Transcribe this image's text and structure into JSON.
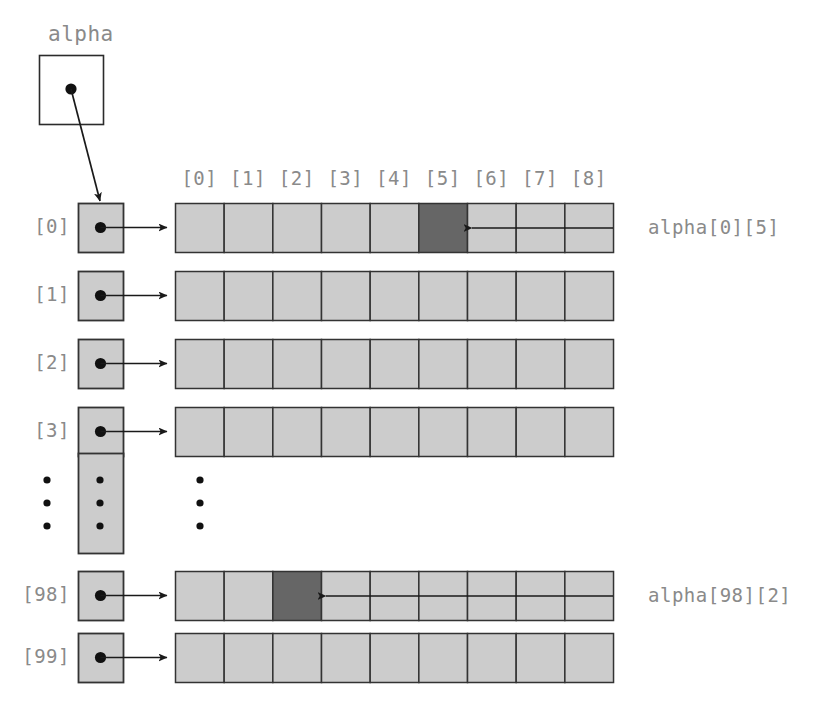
{
  "figure": {
    "kind": "pointer-array-diagram",
    "title": "alpha",
    "background_color": "#ffffff",
    "cell_fill_light": "#cccccc",
    "cell_fill_dark": "#666666",
    "cell_stroke": "#333333",
    "text_color": "#8a8a8a",
    "line_color": "#1a1a1a"
  },
  "pointer_box": {
    "label": "alpha",
    "x": 39,
    "y": 55,
    "w": 64,
    "h": 69,
    "dot": {
      "x": 71,
      "y": 89
    },
    "arrow_to": {
      "x": 100,
      "y": 201
    }
  },
  "column_headers": {
    "labels": [
      "[0]",
      "[1]",
      "[2]",
      "[3]",
      "[4]",
      "[5]",
      "[6]",
      "[7]",
      "[8]"
    ],
    "y": 167
  },
  "row_labels": [
    "[0]",
    "[1]",
    "[2]",
    "[3]",
    "[98]",
    "[99]"
  ],
  "geometry": {
    "ptr_col_x": 78,
    "ptr_col_w": 45,
    "row_h": 49,
    "array_x": 175,
    "array_w": 438,
    "cell_w": 48.67,
    "cell_count": 9,
    "row_y": [
      203,
      271,
      339,
      407,
      571,
      633
    ],
    "label_x_right": 70,
    "ellipsis_box": {
      "x": 78,
      "y": 453,
      "w": 45,
      "h": 100
    },
    "ellipsis_dot_columns_x": [
      47,
      100,
      200
    ],
    "ellipsis_dots_y": [
      480,
      503,
      526
    ]
  },
  "rows": [
    {
      "index_label": "[0]",
      "highlight_cell": 5,
      "y": 203
    },
    {
      "index_label": "[1]",
      "highlight_cell": null,
      "y": 271
    },
    {
      "index_label": "[2]",
      "highlight_cell": null,
      "y": 339
    },
    {
      "index_label": "[3]",
      "highlight_cell": null,
      "y": 407
    },
    {
      "index_label": "[98]",
      "highlight_cell": 2,
      "y": 571
    },
    {
      "index_label": "[99]",
      "highlight_cell": null,
      "y": 633
    }
  ],
  "callouts": [
    {
      "text": "alpha[0][5]",
      "text_x": 648,
      "text_y": 218,
      "line_from_x": 613,
      "line_to_x": 472,
      "line_y": 228
    },
    {
      "text": "alpha[98][2]",
      "text_x": 648,
      "text_y": 586,
      "line_from_x": 613,
      "line_to_x": 326,
      "line_y": 596
    }
  ]
}
